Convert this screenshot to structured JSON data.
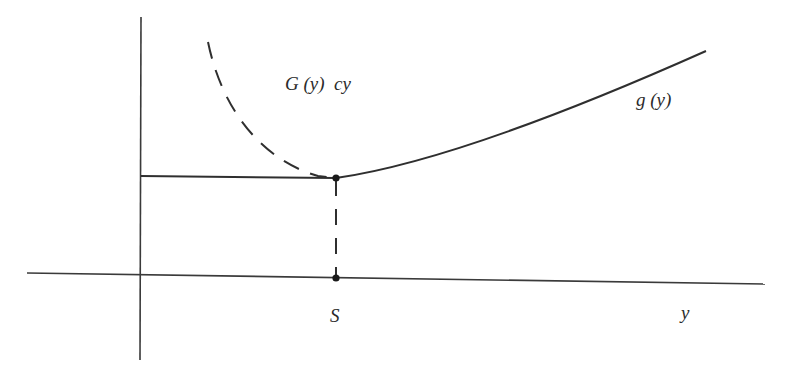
{
  "diagram": {
    "labels": {
      "dashed_curve": "G (y)  cy",
      "solid_curve": "g (y)",
      "threshold": "S",
      "x_axis": "y"
    },
    "colors": {
      "ink": "#2f2f2f",
      "background": "#ffffff"
    },
    "elements": {
      "y_axis": {
        "x": 141,
        "y_top": 17,
        "y_bottom": 360
      },
      "x_axis": {
        "x_start": 27,
        "y_start": 273,
        "x_end": 765,
        "y_end": 284
      },
      "flat_segment": {
        "x_start": 141,
        "x_end": 336,
        "y": 177
      },
      "point_on_curve": {
        "x": 336,
        "y": 178
      },
      "point_on_axis": {
        "x": 336,
        "y": 278
      },
      "g_curve_end": {
        "x": 706,
        "y": 51
      },
      "dashed_curve_start": {
        "x": 208,
        "y": 42
      }
    }
  }
}
